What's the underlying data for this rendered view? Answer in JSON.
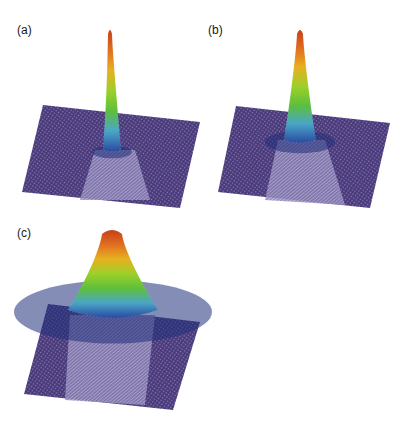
{
  "figure": {
    "panels": [
      {
        "id": "a",
        "label": "(a)",
        "peak_sharpness": "very narrow",
        "relative_width": 0.35
      },
      {
        "id": "b",
        "label": "(b)",
        "peak_sharpness": "narrow",
        "relative_width": 0.6
      },
      {
        "id": "c",
        "label": "(c)",
        "peak_sharpness": "broad",
        "relative_width": 1.0
      }
    ],
    "colormap": [
      "#3b2a6b",
      "#2f4fa6",
      "#4aa0c8",
      "#5fbf3f",
      "#b5d12a",
      "#f0a020",
      "#d94a18"
    ],
    "colormap_meaning": "low (purple) to high (red)"
  }
}
